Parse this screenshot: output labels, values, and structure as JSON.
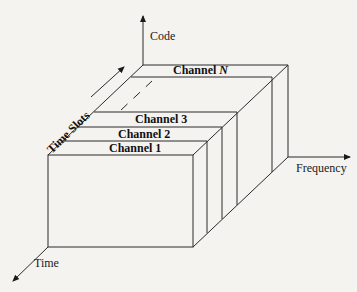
{
  "diagram": {
    "type": "3d-box-channel-allocation",
    "axes": {
      "code": "Code",
      "frequency": "Frequency",
      "time": "Time"
    },
    "time_slots_label": "Time Slots",
    "channels": [
      {
        "label": "Channel 1"
      },
      {
        "label": "Channel 2"
      },
      {
        "label": "Channel 3"
      },
      {
        "label": "Channel",
        "suffix": "N"
      }
    ],
    "colors": {
      "line": "#2a2a2a",
      "background": "#f4f3f0"
    }
  }
}
